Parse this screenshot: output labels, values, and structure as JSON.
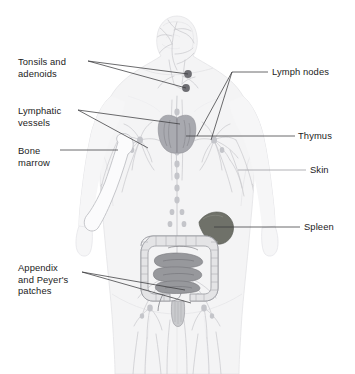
{
  "figure": {
    "background_color": "#ffffff",
    "width": 355,
    "height": 374
  },
  "palette": {
    "body_fill": "#f4f4f5",
    "body_outline": "#dcdcdf",
    "vessel_line": "#c6c7cb",
    "vessel_line_dark": "#adaeb4",
    "node_dot": "#b9bac0",
    "tonsil_dot": "#6e6e73",
    "thymus_fill": "#a9aab0",
    "spleen_fill": "#6f7169",
    "colon_fill": "#e2e2e4",
    "colon_outline": "#9d9ea4",
    "small_intestine_fill": "#97989c",
    "bone_outline": "#bdbec3",
    "leader_line": "#3a3a3c",
    "leader_line_light": "#9a9a9e",
    "text": "#1b1b1b"
  },
  "labels": [
    {
      "id": "tonsils-and-adenoids",
      "text": "Tonsils and\nadenoids",
      "side": "left",
      "x": 18,
      "y": 56,
      "lines": 2
    },
    {
      "id": "lymphatic-vessels",
      "text": "Lymphatic\nvessels",
      "side": "left",
      "x": 18,
      "y": 105,
      "lines": 2
    },
    {
      "id": "bone-marrow",
      "text": "Bone\nmarrow",
      "side": "left",
      "x": 18,
      "y": 145,
      "lines": 2
    },
    {
      "id": "appendix-and-peyers-patches",
      "text": "Appendix\nand Peyer's\npatches",
      "side": "left",
      "x": 18,
      "y": 262,
      "lines": 3
    },
    {
      "id": "lymph-nodes",
      "text": "Lymph nodes",
      "side": "right",
      "x": 272,
      "y": 72,
      "lines": 1
    },
    {
      "id": "thymus",
      "text": "Thymus",
      "side": "right",
      "x": 298,
      "y": 136,
      "lines": 1
    },
    {
      "id": "skin",
      "text": "Skin",
      "side": "right",
      "x": 310,
      "y": 170,
      "lines": 1
    },
    {
      "id": "spleen",
      "text": "Spleen",
      "side": "right",
      "x": 304,
      "y": 227,
      "lines": 1
    }
  ],
  "leader_lines": [
    {
      "id": "leader-tonsils-upper",
      "from": [
        88,
        61
      ],
      "to": [
        188,
        74
      ],
      "color": "leader_line"
    },
    {
      "id": "leader-tonsils-lower",
      "from": [
        88,
        61
      ],
      "to": [
        186,
        88
      ],
      "color": "leader_line"
    },
    {
      "id": "leader-lymphatic-vessels-upper",
      "from": [
        78,
        110
      ],
      "to": [
        180,
        124
      ],
      "color": "leader_line"
    },
    {
      "id": "leader-lymphatic-vessels-lower",
      "from": [
        78,
        110
      ],
      "to": [
        148,
        148
      ],
      "color": "leader_line"
    },
    {
      "id": "leader-bone-marrow",
      "from": [
        60,
        150
      ],
      "to": [
        117,
        150
      ],
      "color": "leader_line"
    },
    {
      "id": "leader-appendix-upper",
      "from": [
        82,
        272
      ],
      "to": [
        184,
        290
      ],
      "color": "leader_line"
    },
    {
      "id": "leader-appendix-lower",
      "from": [
        82,
        272
      ],
      "to": [
        190,
        302
      ],
      "color": "leader_line"
    },
    {
      "id": "leader-lymph-nodes-upper",
      "from": [
        268,
        72
      ],
      "to": [
        232,
        72
      ],
      "color": "leader_line"
    },
    {
      "id": "leader-lymph-nodes-branch-a",
      "from": [
        232,
        72
      ],
      "to": [
        196,
        136
      ],
      "color": "leader_line"
    },
    {
      "id": "leader-lymph-nodes-branch-b",
      "from": [
        232,
        72
      ],
      "to": [
        210,
        139
      ],
      "color": "leader_line"
    },
    {
      "id": "leader-thymus",
      "from": [
        295,
        136
      ],
      "to": [
        186,
        136
      ],
      "color": "leader_line"
    },
    {
      "id": "leader-skin",
      "from": [
        306,
        170
      ],
      "to": [
        238,
        170
      ],
      "color": "leader_line_light"
    },
    {
      "id": "leader-spleen",
      "from": [
        300,
        227
      ],
      "to": [
        216,
        227
      ],
      "color": "leader_line"
    }
  ],
  "anatomy": [
    {
      "id": "body-silhouette",
      "name": "human body outline, front view"
    },
    {
      "id": "head",
      "name": "head and neck"
    },
    {
      "id": "tonsils",
      "name": "tonsils and adenoids, two dark nodes in the throat"
    },
    {
      "id": "thymus",
      "name": "thymus, bilobed organ behind the sternum"
    },
    {
      "id": "spleen",
      "name": "spleen, upper left abdomen"
    },
    {
      "id": "large-intestine",
      "name": "large intestine / colon frame"
    },
    {
      "id": "small-intestine",
      "name": "small intestine coils with Peyer's patches"
    },
    {
      "id": "appendix",
      "name": "appendix at lower right of colon"
    },
    {
      "id": "humerus",
      "name": "upper arm bone containing marrow"
    },
    {
      "id": "lymphatic-network",
      "name": "network of lymphatic vessels and nodes throughout the body"
    }
  ]
}
